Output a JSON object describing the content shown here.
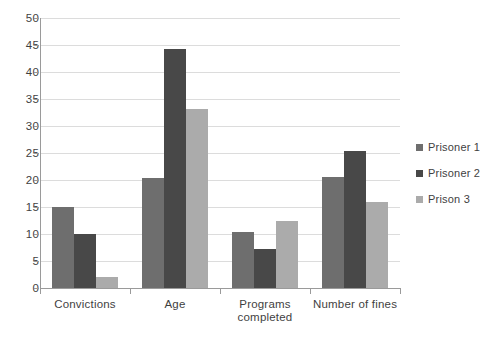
{
  "chart_data": {
    "type": "bar",
    "title": "",
    "subtitle": "",
    "xlabel": "",
    "ylabel": "",
    "categories": [
      "Convictions",
      "Age",
      "Programs completed",
      "Number of fines"
    ],
    "category_lines": [
      [
        "Convictions"
      ],
      [
        "Age"
      ],
      [
        "Programs",
        "completed"
      ],
      [
        "Number of fines"
      ]
    ],
    "series": [
      {
        "name": "Prisoner 1",
        "color": "#6e6e6e",
        "values": [
          15,
          20.3,
          10.3,
          20.5
        ]
      },
      {
        "name": "Prisoner 2",
        "color": "#484848",
        "values": [
          10,
          44.2,
          7.3,
          25.4
        ]
      },
      {
        "name": "Prison 3",
        "color": "#ababab",
        "values": [
          2,
          33.2,
          12.4,
          15.9
        ]
      }
    ],
    "ylim": [
      0,
      50
    ],
    "yticks": [
      0,
      5,
      10,
      15,
      20,
      25,
      30,
      35,
      40,
      45,
      50
    ],
    "ytick_labels": [
      "0",
      "5",
      "10",
      "15",
      "20",
      "25",
      "30",
      "35",
      "40",
      "45",
      "50"
    ],
    "grid": true,
    "grid_axis": "y",
    "legend_position": "right",
    "background": "#ffffff",
    "gridline_color": "#dcdcdc",
    "axis_color": "#9a9a9a"
  }
}
